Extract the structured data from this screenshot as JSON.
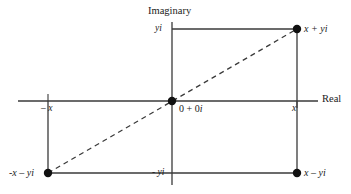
{
  "figure": {
    "type": "diagram",
    "background_color": "#ffffff",
    "line_color": "#3a3a3a",
    "dot_color": "#111111",
    "text_color": "#1a1a1a"
  },
  "axes": {
    "horizontal": {
      "label": "Real",
      "y": 101,
      "x_start": 18,
      "x_end": 318
    },
    "vertical": {
      "label": "Imaginary",
      "x": 172,
      "y_start": 22,
      "y_end": 185
    }
  },
  "ticks": [
    {
      "name": "tick-x-positive",
      "label": "x",
      "x": 297,
      "y": 101
    },
    {
      "name": "tick-x-negative",
      "label": "– x",
      "x": 48,
      "y": 101
    },
    {
      "name": "tick-yi-positive",
      "label": "yi",
      "x": 172,
      "y": 29
    },
    {
      "name": "tick-yi-negative",
      "label": "- yi",
      "x": 172,
      "y": 173
    }
  ],
  "points": [
    {
      "name": "point-x-plus-yi",
      "label": "x + yi",
      "x": 297,
      "y": 29,
      "quadrant": "upper-right"
    },
    {
      "name": "point-x-minus-yi",
      "label": "x – yi",
      "x": 297,
      "y": 173,
      "quadrant": "lower-right"
    },
    {
      "name": "point-negx-minus-yi",
      "label": "-x – yi",
      "x": 48,
      "y": 173,
      "quadrant": "lower-left"
    },
    {
      "name": "point-origin",
      "label": "0 + 0i",
      "label_real": "0 + 0",
      "label_imag": "i",
      "x": 172,
      "y": 101,
      "quadrant": "origin"
    }
  ],
  "segments": {
    "top_edge": {
      "x1": 172,
      "y1": 29,
      "x2": 297,
      "y2": 29
    },
    "right_edge": {
      "x1": 297,
      "y1": 29,
      "x2": 297,
      "y2": 173
    },
    "bottom_edge": {
      "x1": 48,
      "y1": 173,
      "x2": 297,
      "y2": 173
    },
    "left_edge": {
      "x1": 48,
      "y1": 101,
      "x2": 48,
      "y2": 173
    }
  },
  "diagonal": {
    "name": "dashed-diagonal",
    "from": {
      "x": 48,
      "y": 173
    },
    "to": {
      "x": 297,
      "y": 29
    },
    "style": "dashed"
  }
}
